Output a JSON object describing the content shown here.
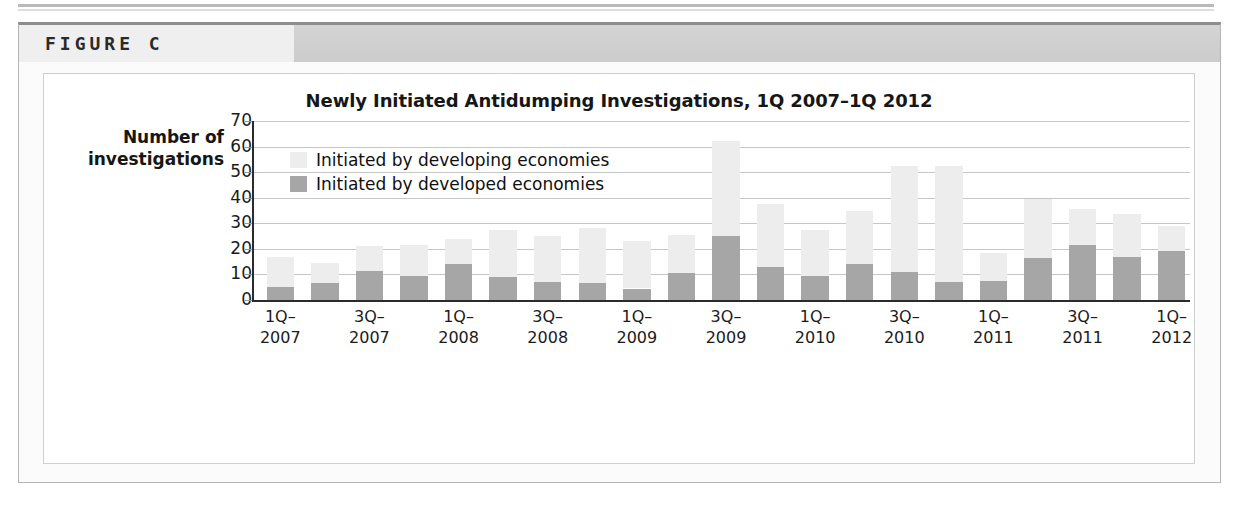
{
  "figure": {
    "label": "FIGURE C"
  },
  "chart_data": {
    "type": "bar",
    "subtype": "stacked-vertical",
    "title": "Newly Initiated Antidumping Investigations, 1Q 2007–1Q 2012",
    "xlabel": "",
    "ylabel": "Number of investigations",
    "ylabel_lines": [
      "Number of",
      "investigations"
    ],
    "ylim": [
      0,
      70
    ],
    "yticks": [
      0,
      10,
      20,
      30,
      40,
      50,
      60,
      70
    ],
    "ytick_labels": [
      "0",
      "10",
      "20",
      "30",
      "40",
      "50",
      "60",
      "70"
    ],
    "grid": true,
    "legend_position": "top-left-inside",
    "colors": {
      "developing": "#ededed",
      "developed": "#a6a6a6",
      "axis": "#2b2b2b",
      "gridline": "#c6c6c6",
      "text": "#161616"
    },
    "categories": [
      "1Q-2007",
      "2Q-2007",
      "3Q-2007",
      "4Q-2007",
      "1Q-2008",
      "2Q-2008",
      "3Q-2008",
      "4Q-2008",
      "1Q-2009",
      "2Q-2009",
      "3Q-2009",
      "4Q-2009",
      "1Q-2010",
      "2Q-2010",
      "3Q-2010",
      "4Q-2010",
      "1Q-2011",
      "2Q-2011",
      "3Q-2011",
      "4Q-2011",
      "1Q-2012"
    ],
    "tick_labels": [
      {
        "index": 0,
        "line1": "1Q–",
        "line2": "2007"
      },
      {
        "index": 2,
        "line1": "3Q–",
        "line2": "2007"
      },
      {
        "index": 4,
        "line1": "1Q–",
        "line2": "2008"
      },
      {
        "index": 6,
        "line1": "3Q–",
        "line2": "2008"
      },
      {
        "index": 8,
        "line1": "1Q–",
        "line2": "2009"
      },
      {
        "index": 10,
        "line1": "3Q–",
        "line2": "2009"
      },
      {
        "index": 12,
        "line1": "1Q–",
        "line2": "2010"
      },
      {
        "index": 14,
        "line1": "3Q–",
        "line2": "2010"
      },
      {
        "index": 16,
        "line1": "1Q–",
        "line2": "2011"
      },
      {
        "index": 18,
        "line1": "3Q–",
        "line2": "2011"
      },
      {
        "index": 20,
        "line1": "1Q–",
        "line2": "2012"
      }
    ],
    "series": [
      {
        "name": "Initiated by developed economies",
        "color": "#a6a6a6",
        "values": [
          5,
          6.5,
          11.5,
          9.5,
          14,
          9,
          7,
          6.5,
          4.5,
          10.5,
          25,
          13,
          9.5,
          14,
          11,
          7,
          7.5,
          16.5,
          21.5,
          17,
          19
        ]
      },
      {
        "name": "Initiated by developing economies",
        "color": "#ededed",
        "values": [
          12,
          8,
          9.5,
          12,
          10,
          18.5,
          18,
          21.5,
          18.5,
          15,
          37,
          24.5,
          18,
          21,
          41.5,
          45.5,
          11,
          23,
          14,
          16.5,
          10
        ]
      }
    ],
    "totals": [
      17,
      14.5,
      21,
      21.5,
      24,
      27.5,
      25,
      28,
      23,
      25.5,
      62,
      37.5,
      27.5,
      35,
      52.5,
      52.5,
      18.5,
      39.5,
      35.5,
      33.5,
      29
    ],
    "legend": [
      {
        "label": "Initiated by developing economies",
        "color": "#ededed",
        "swatch": "legend-swatch-developing"
      },
      {
        "label": "Initiated by developed economies",
        "color": "#a6a6a6",
        "swatch": "legend-swatch-developed"
      }
    ]
  }
}
